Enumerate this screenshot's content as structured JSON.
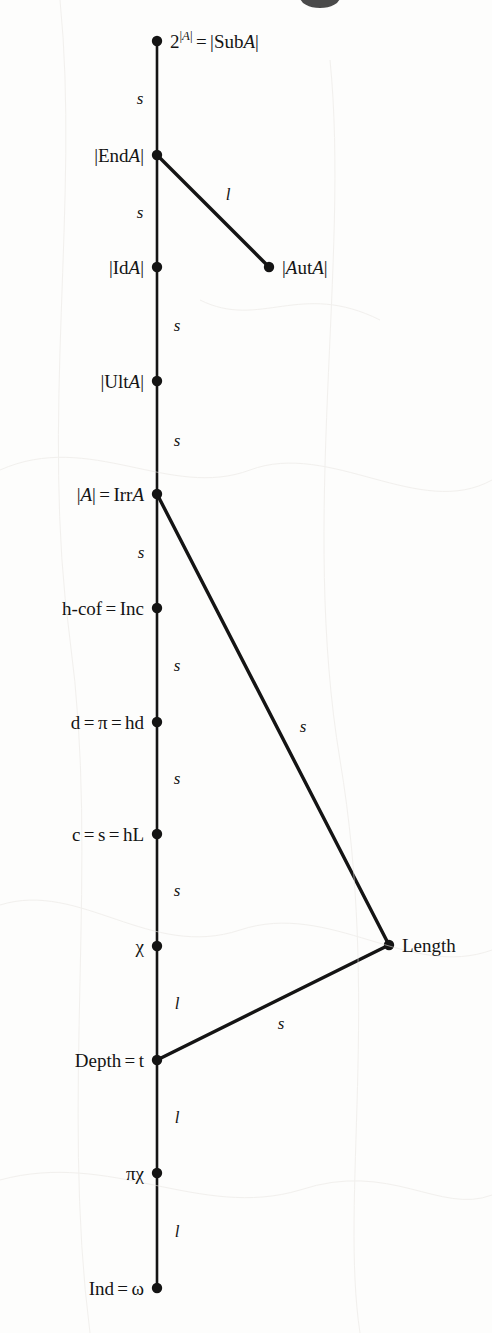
{
  "figure": {
    "type": "hasse-diagram",
    "title": "",
    "background_color": "#fdfdfc",
    "ink_color": "#141414",
    "width": 492,
    "height": 1333
  },
  "nodes": [
    {
      "id": "sub",
      "label_html": "2<sup>|A|</sup> = |SubA|",
      "label_text": "2^|A| = |SubA|",
      "x": 157,
      "y": 41,
      "label_side": "right"
    },
    {
      "id": "end",
      "label_html": "|EndA|",
      "label_text": "|EndA|",
      "x": 157,
      "y": 155,
      "label_side": "left"
    },
    {
      "id": "id",
      "label_html": "|IdA|",
      "label_text": "|IdA|",
      "x": 157,
      "y": 267,
      "label_side": "left"
    },
    {
      "id": "aut",
      "label_html": "|AutA|",
      "label_text": "|AutA|",
      "x": 269,
      "y": 267,
      "label_side": "right"
    },
    {
      "id": "ult",
      "label_html": "|UltA|",
      "label_text": "|UltA|",
      "x": 157,
      "y": 381,
      "label_side": "left"
    },
    {
      "id": "irr",
      "label_html": "|A| = IrrA",
      "label_text": "|A| = IrrA",
      "x": 157,
      "y": 494,
      "label_side": "left"
    },
    {
      "id": "hcof",
      "label_html": "h-cof = Inc",
      "label_text": "h-cof = Inc",
      "x": 157,
      "y": 608,
      "label_side": "left"
    },
    {
      "id": "d",
      "label_html": "d = π = hd",
      "label_text": "d = π = hd",
      "x": 157,
      "y": 722,
      "label_side": "left"
    },
    {
      "id": "c",
      "label_html": "c = s = hL",
      "label_text": "c = s = hL",
      "x": 157,
      "y": 834,
      "label_side": "left"
    },
    {
      "id": "chi",
      "label_html": "χ",
      "label_text": "χ",
      "x": 157,
      "y": 946,
      "label_side": "left"
    },
    {
      "id": "length",
      "label_html": "Length",
      "label_text": "Length",
      "x": 389,
      "y": 945,
      "label_side": "right"
    },
    {
      "id": "depth",
      "label_html": "Depth = t",
      "label_text": "Depth = t",
      "x": 157,
      "y": 1060,
      "label_side": "left"
    },
    {
      "id": "pichi",
      "label_html": "πχ",
      "label_text": "πχ",
      "x": 157,
      "y": 1173,
      "label_side": "left"
    },
    {
      "id": "ind",
      "label_html": "Ind = ω",
      "label_text": "Ind = ω",
      "x": 157,
      "y": 1288,
      "label_side": "left"
    }
  ],
  "edges": [
    {
      "from": "sub",
      "to": "end",
      "label": "s",
      "label_x": 140,
      "label_y": 98,
      "kind": "chain"
    },
    {
      "from": "end",
      "to": "id",
      "label": "s",
      "label_x": 140,
      "label_y": 212,
      "kind": "chain"
    },
    {
      "from": "end",
      "to": "aut",
      "label": "l",
      "label_x": 228,
      "label_y": 194,
      "kind": "branch"
    },
    {
      "from": "id",
      "to": "ult",
      "label": "s",
      "label_x": 177,
      "label_y": 325,
      "kind": "chain"
    },
    {
      "from": "ult",
      "to": "irr",
      "label": "s",
      "label_x": 177,
      "label_y": 440,
      "kind": "chain"
    },
    {
      "from": "irr",
      "to": "hcof",
      "label": "s",
      "label_x": 141,
      "label_y": 552,
      "kind": "chain"
    },
    {
      "from": "irr",
      "to": "length",
      "label": "s",
      "label_x": 303,
      "label_y": 726,
      "kind": "branch"
    },
    {
      "from": "hcof",
      "to": "d",
      "label": "s",
      "label_x": 177,
      "label_y": 665,
      "kind": "chain"
    },
    {
      "from": "d",
      "to": "c",
      "label": "s",
      "label_x": 177,
      "label_y": 778,
      "kind": "chain"
    },
    {
      "from": "c",
      "to": "chi",
      "label": "s",
      "label_x": 177,
      "label_y": 890,
      "kind": "chain"
    },
    {
      "from": "chi",
      "to": "depth",
      "label": "l",
      "label_x": 177,
      "label_y": 1003,
      "kind": "chain"
    },
    {
      "from": "depth",
      "to": "length",
      "label": "s",
      "label_x": 281,
      "label_y": 1023,
      "kind": "branch"
    },
    {
      "from": "depth",
      "to": "pichi",
      "label": "l",
      "label_x": 177,
      "label_y": 1117,
      "kind": "chain"
    },
    {
      "from": "pichi",
      "to": "ind",
      "label": "l",
      "label_x": 177,
      "label_y": 1231,
      "kind": "chain"
    }
  ],
  "legend": {
    "s_meaning": "s",
    "l_meaning": "l"
  }
}
